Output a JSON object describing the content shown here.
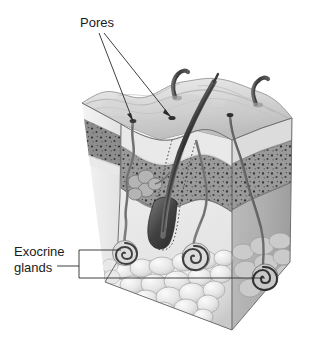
{
  "figure": {
    "background_color": "#ffffff"
  },
  "labels": {
    "pores": {
      "text": "Pores",
      "x": 80,
      "y": 27
    },
    "exocrine_glands": {
      "line1": "Exocrine",
      "line2": "glands",
      "x": 14,
      "y1": 256,
      "y2": 272
    }
  },
  "leader_lines": {
    "color": "#2a2a2a",
    "pores": [
      {
        "name": "pore-leader-left",
        "x1": 99,
        "y1": 33,
        "x2": 133,
        "y2": 122
      },
      {
        "name": "pore-leader-right",
        "x1": 104,
        "y1": 33,
        "x2": 172,
        "y2": 118
      }
    ],
    "exocrine_bracket": {
      "stem_x1": 57,
      "stem_x2": 79,
      "stem_y": 266,
      "vertical_x": 79,
      "vertical_y1": 250,
      "vertical_y2": 278,
      "arm_top": {
        "x1": 79,
        "y1": 250,
        "x2": 121,
        "y2": 250
      },
      "arm_bottom": {
        "x1": 79,
        "y1": 278,
        "x2": 265,
        "y2": 278
      }
    }
  },
  "colors": {
    "epidermis_surface": "#d8d8d8",
    "epidermis_shadow": "#b8b8b8",
    "dermis_band": "#9a9a9a",
    "dermis_speckle": "#3a3a3a",
    "subcutaneous": "#ededed",
    "right_face": "#b0b0b0",
    "right_face_dark": "#a0a0a0",
    "fat_lobule": "#e4e4e4",
    "fat_outline": "#9c9c9c",
    "hair": "#4a4a4a",
    "hair_dark": "#2e2e2e",
    "duct": "#6e6e6e",
    "gland_coil": "#555555",
    "outline": "#6a6a6a"
  },
  "anatomy": {
    "block": {
      "name": "skin-block",
      "top_left": [
        82,
        103
      ],
      "top_mid": [
        232,
        84
      ],
      "top_right": [
        292,
        118
      ],
      "front_bottom": [
        232,
        330
      ],
      "left_bottom": [
        105,
        282
      ],
      "right_bottom": [
        290,
        262
      ]
    },
    "hairs": [
      {
        "name": "hair-left-small",
        "emerges_at": [
          178,
          97
        ]
      },
      {
        "name": "hair-center-large",
        "emerges_at": [
          196,
          130
        ],
        "bulb_at": [
          156,
          240
        ]
      },
      {
        "name": "hair-right-small",
        "emerges_at": [
          258,
          103
        ]
      }
    ],
    "pores": [
      {
        "name": "pore-surface-left",
        "at": [
          133,
          122
        ]
      },
      {
        "name": "pore-surface-right",
        "at": [
          172,
          118
        ]
      },
      {
        "name": "pore-surface-far-right",
        "at": [
          230,
          116
        ]
      }
    ],
    "glands": [
      {
        "name": "exocrine-gland-left",
        "coil_at": [
          125,
          252
        ]
      },
      {
        "name": "exocrine-gland-center",
        "coil_at": [
          196,
          258
        ]
      },
      {
        "name": "exocrine-gland-right",
        "coil_at": [
          265,
          276
        ]
      }
    ],
    "sebaceous_gland": {
      "name": "sebaceous-gland",
      "at": [
        140,
        186
      ]
    }
  }
}
